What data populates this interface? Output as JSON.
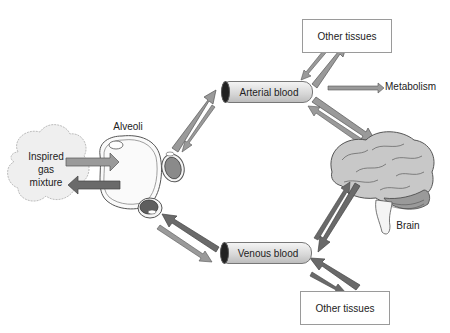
{
  "diagram": {
    "type": "physiology flow diagram",
    "nodes": {
      "inspired": {
        "label_lines": [
          "Inspired",
          "gas",
          "mixture"
        ]
      },
      "alveoli": {
        "label": "Alveoli"
      },
      "arterial": {
        "label": "Arterial blood"
      },
      "venous": {
        "label": "Venous blood"
      },
      "other_tissues_top": {
        "label": "Other tissues"
      },
      "other_tissues_bottom": {
        "label": "Other tissues"
      },
      "metabolism": {
        "label": "Metabolism"
      },
      "brain": {
        "label": "Brain"
      }
    },
    "edges": [
      {
        "from": "Inspired gas mixture",
        "to": "Alveoli"
      },
      {
        "from": "Alveoli",
        "to": "Inspired gas mixture"
      },
      {
        "from": "Alveoli",
        "to": "Arterial blood"
      },
      {
        "from": "Arterial blood",
        "to": "Alveoli"
      },
      {
        "from": "Venous blood",
        "to": "Alveoli"
      },
      {
        "from": "Alveoli",
        "to": "Venous blood"
      },
      {
        "from": "Arterial blood",
        "to": "Other tissues (top)"
      },
      {
        "from": "Other tissues (top)",
        "to": "Arterial blood"
      },
      {
        "from": "Arterial blood",
        "to": "Metabolism"
      },
      {
        "from": "Arterial blood",
        "to": "Brain"
      },
      {
        "from": "Brain",
        "to": "Arterial blood"
      },
      {
        "from": "Brain",
        "to": "Venous blood"
      },
      {
        "from": "Venous blood",
        "to": "Brain"
      },
      {
        "from": "Other tissues (bottom)",
        "to": "Venous blood"
      },
      {
        "from": "Venous blood",
        "to": "Other tissues (bottom)"
      }
    ],
    "colors": {
      "arrow_light": "#9a9a9a",
      "arrow_dark": "#6a6a6a",
      "outline": "#555555",
      "brain_fill": "#c8c8c8",
      "cloud_fill": "#efefef"
    }
  }
}
